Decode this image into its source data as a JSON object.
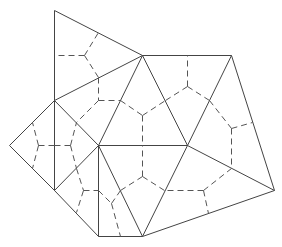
{
  "diagram": {
    "colors": {
      "solid": "#444444",
      "dashed": "#555555",
      "background": "#ffffff"
    },
    "vertices": {
      "A": [
        54,
        10
      ],
      "B": [
        142,
        55
      ],
      "C": [
        231,
        55
      ],
      "D": [
        54,
        100
      ],
      "E": [
        9,
        145
      ],
      "F": [
        98,
        145
      ],
      "G": [
        54,
        190
      ],
      "H": [
        187,
        145
      ],
      "I": [
        274,
        190
      ],
      "J": [
        98,
        236
      ],
      "K": [
        142,
        236
      ]
    },
    "solid_edges": [
      [
        "A",
        "B"
      ],
      [
        "A",
        "D"
      ],
      [
        "D",
        "B"
      ],
      [
        "B",
        "C"
      ],
      [
        "B",
        "F"
      ],
      [
        "B",
        "H"
      ],
      [
        "C",
        "H"
      ],
      [
        "C",
        "I"
      ],
      [
        "H",
        "I"
      ],
      [
        "D",
        "E"
      ],
      [
        "D",
        "F"
      ],
      [
        "D",
        "G"
      ],
      [
        "E",
        "G"
      ],
      [
        "G",
        "F"
      ],
      [
        "F",
        "H"
      ],
      [
        "F",
        "J"
      ],
      [
        "F",
        "K"
      ],
      [
        "G",
        "J"
      ],
      [
        "J",
        "K"
      ],
      [
        "K",
        "H"
      ],
      [
        "K",
        "I"
      ]
    ],
    "dashed_segments": [
      [
        [
          84,
          55
        ],
        [
          54,
          55
        ]
      ],
      [
        [
          84,
          55
        ],
        [
          98,
          32
        ]
      ],
      [
        [
          84,
          55
        ],
        [
          98,
          77
        ]
      ],
      [
        [
          98,
          77
        ],
        [
          98,
          100
        ]
      ],
      [
        [
          98,
          100
        ],
        [
          120,
          100
        ]
      ],
      [
        [
          120,
          100
        ],
        [
          142,
          115
        ]
      ],
      [
        [
          98,
          100
        ],
        [
          76,
          122
        ]
      ],
      [
        [
          38,
          145
        ],
        [
          32,
          122
        ]
      ],
      [
        [
          38,
          145
        ],
        [
          32,
          168
        ]
      ],
      [
        [
          38,
          145
        ],
        [
          54,
          145
        ]
      ],
      [
        [
          70,
          145
        ],
        [
          54,
          145
        ]
      ],
      [
        [
          70,
          145
        ],
        [
          76,
          122
        ]
      ],
      [
        [
          70,
          145
        ],
        [
          76,
          168
        ]
      ],
      [
        [
          76,
          168
        ],
        [
          83,
          190
        ]
      ],
      [
        [
          83,
          190
        ],
        [
          76,
          212
        ]
      ],
      [
        [
          83,
          190
        ],
        [
          98,
          190
        ]
      ],
      [
        [
          98,
          190
        ],
        [
          111,
          203
        ]
      ],
      [
        [
          111,
          203
        ],
        [
          120,
          190
        ]
      ],
      [
        [
          111,
          203
        ],
        [
          120,
          236
        ]
      ],
      [
        [
          142,
          115
        ],
        [
          165,
          100
        ]
      ],
      [
        [
          142,
          115
        ],
        [
          142,
          145
        ]
      ],
      [
        [
          187,
          86
        ],
        [
          187,
          55
        ]
      ],
      [
        [
          187,
          86
        ],
        [
          165,
          100
        ]
      ],
      [
        [
          187,
          86
        ],
        [
          209,
          100
        ]
      ],
      [
        [
          209,
          100
        ],
        [
          231,
          128
        ]
      ],
      [
        [
          231,
          128
        ],
        [
          252,
          122
        ]
      ],
      [
        [
          231,
          128
        ],
        [
          231,
          168
        ]
      ],
      [
        [
          142,
          176
        ],
        [
          142,
          145
        ]
      ],
      [
        [
          142,
          176
        ],
        [
          120,
          190
        ]
      ],
      [
        [
          142,
          176
        ],
        [
          164,
          190
        ]
      ],
      [
        [
          203,
          190
        ],
        [
          164,
          190
        ]
      ],
      [
        [
          203,
          190
        ],
        [
          231,
          168
        ]
      ],
      [
        [
          203,
          190
        ],
        [
          208,
          213
        ]
      ]
    ]
  }
}
